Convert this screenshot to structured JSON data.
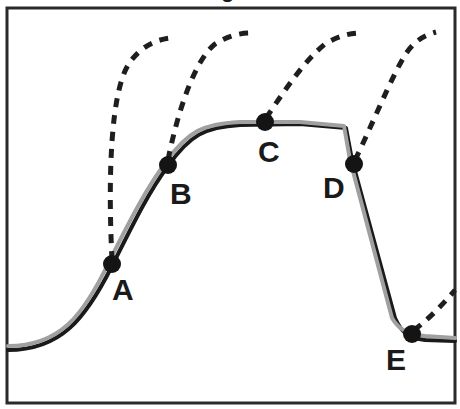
{
  "diagram": {
    "type": "trajectory-curve",
    "title_fragment": "g",
    "frame": {
      "x": 7,
      "y": 8,
      "width": 448,
      "height": 395
    },
    "colors": {
      "frame": "#2a2a2a",
      "main_curve_dark": "#1a1a1a",
      "main_curve_light": "#a0a0a0",
      "dashed": "#1e1e1e",
      "points": "#141414",
      "labels": "#1a1a1a"
    },
    "main_curve": {
      "description": "S-shaped rise to plateau, steep drop, low plateau",
      "path_dark": "M 8 350 C 60 350, 85 320, 112 266 C 135 220, 150 190, 168 166 C 190 135, 205 127, 240 125 L 300 124 L 346 128 L 352 160 L 395 318 C 402 334, 410 338, 425 340 L 455 341",
      "path_light": "M 8 346 C 60 346, 83 316, 109 262 C 132 216, 148 186, 166 162 C 188 131, 203 124, 240 122 L 300 122 L 344 126 L 350 160 L 392 318 C 399 330, 408 334, 425 336 L 455 338"
    },
    "points": [
      {
        "id": "A",
        "label": "A",
        "x": 112,
        "y": 264,
        "label_x": 112,
        "label_y": 300
      },
      {
        "id": "B",
        "label": "B",
        "x": 168,
        "y": 165,
        "label_x": 170,
        "label_y": 204
      },
      {
        "id": "C",
        "label": "C",
        "x": 265,
        "y": 122,
        "label_x": 258,
        "label_y": 162
      },
      {
        "id": "D",
        "label": "D",
        "x": 354,
        "y": 164,
        "label_x": 323,
        "label_y": 198
      },
      {
        "id": "E",
        "label": "E",
        "x": 412,
        "y": 334,
        "label_x": 386,
        "label_y": 370
      }
    ],
    "dashed_trajectories": [
      {
        "from": "A",
        "path": "M 112 260 C 108 180, 110 90, 130 62 C 142 46, 155 40, 170 38"
      },
      {
        "from": "B",
        "path": "M 168 160 C 178 110, 195 60, 215 44 C 228 36, 240 33, 250 33"
      },
      {
        "from": "C",
        "path": "M 266 118 C 285 90, 305 60, 325 44 C 338 36, 350 33, 362 33"
      },
      {
        "from": "D",
        "path": "M 355 160 C 370 130, 390 80, 405 55 C 415 40, 425 35, 436 32"
      },
      {
        "from": "E",
        "path": "M 414 330 C 425 322, 440 308, 455 290"
      }
    ]
  }
}
